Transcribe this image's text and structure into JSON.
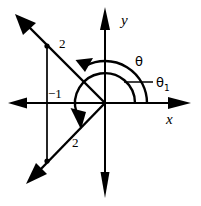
{
  "figure": {
    "kind": "cartesian-angle-diagram",
    "width": 201,
    "height": 206,
    "background_color": "#ffffff",
    "stroke_color": "#000000",
    "origin": {
      "x": 105,
      "y": 103
    }
  },
  "axes": {
    "x_axis": {
      "label": "x",
      "y_pixel": 103,
      "arrow_left": true,
      "arrow_right": true
    },
    "y_axis": {
      "label": "y",
      "x_pixel": 105,
      "arrow_up": true,
      "arrow_down": true
    }
  },
  "labels": {
    "two_upper": "2",
    "two_lower": "2",
    "minus_one": "−1",
    "theta": "θ",
    "theta_one_base": "θ",
    "theta_one_sub": "1"
  },
  "vectors": [
    {
      "name": "vector-upper-left",
      "description": "arrow from origin into second quadrant through (-1, 2)",
      "real_part": -1,
      "imaginary_part": 2,
      "tip": {
        "x": 17,
        "y": 17
      },
      "label": "2"
    },
    {
      "name": "vector-lower-left",
      "description": "arrow from origin into third quadrant through (-1, -2)",
      "real_part": -1,
      "imaginary_part": -2,
      "tip": {
        "x": 28,
        "y": 182
      },
      "label": "2"
    }
  ],
  "projection_line": {
    "name": "projection-x-minus-1",
    "x_pixel": 47,
    "value": "−1"
  },
  "arcs": [
    {
      "name": "arc-theta",
      "label": "θ",
      "radius": 42,
      "start_angle_deg": 0,
      "end_angle_deg": 117,
      "arrow_at": "end",
      "direction": "counterclockwise"
    },
    {
      "name": "arc-theta-1",
      "label": "θ₁",
      "radius": 30,
      "start_angle_deg": 0,
      "end_angle_deg": 243,
      "arrow_at": "end",
      "direction": "counterclockwise"
    }
  ]
}
